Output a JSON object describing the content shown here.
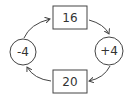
{
  "diagram": {
    "type": "cycle",
    "nodes": [
      {
        "id": "top",
        "shape": "box",
        "label": "16"
      },
      {
        "id": "right",
        "shape": "circle",
        "label": "+4"
      },
      {
        "id": "bottom",
        "shape": "box",
        "label": "20"
      },
      {
        "id": "left",
        "shape": "circle",
        "label": "-4"
      }
    ],
    "edges": [
      {
        "from": "top",
        "to": "right"
      },
      {
        "from": "right",
        "to": "bottom"
      },
      {
        "from": "bottom",
        "to": "left"
      },
      {
        "from": "left",
        "to": "top"
      }
    ],
    "stroke_color": "#444444"
  }
}
